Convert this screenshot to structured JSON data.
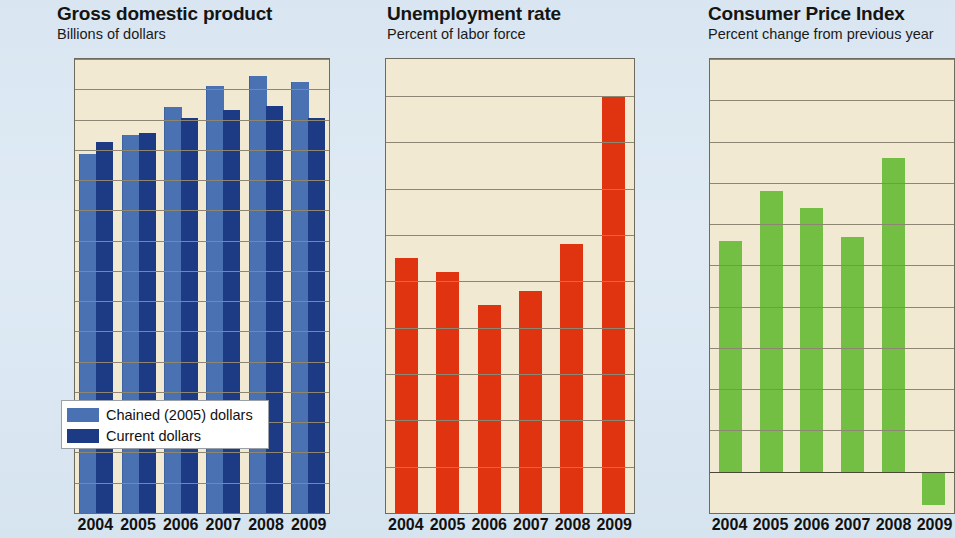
{
  "charts": [
    {
      "id": "gdp",
      "title": "Gross domestic product",
      "subtitle": "Billions of dollars",
      "legend": [
        {
          "label": "Chained (2005) dollars",
          "color": "#4a72b2"
        },
        {
          "label": "Current dollars",
          "color": "#1d3b85"
        }
      ]
    },
    {
      "id": "unemployment",
      "title": "Unemployment rate",
      "subtitle": "Percent of labor force"
    },
    {
      "id": "cpi",
      "title": "Consumer Price Index",
      "subtitle": "Percent change from previous year"
    }
  ],
  "chart_data": [
    {
      "type": "bar",
      "title": "Gross domestic product",
      "subtitle": "Billions of dollars",
      "xlabel": "",
      "ylabel": "Billions of dollars",
      "categories": [
        "2004",
        "2005",
        "2006",
        "2007",
        "2008",
        "2009"
      ],
      "series": [
        {
          "name": "Chained (2005) dollars",
          "color": "#4a72b2",
          "values": [
            11850,
            12500,
            13400,
            14100,
            14450,
            14250
          ]
        },
        {
          "name": "Current dollars",
          "color": "#1d3b85",
          "values": [
            12250,
            12550,
            13050,
            13300,
            13450,
            13050
          ]
        }
      ],
      "ylim": [
        0,
        15000
      ],
      "yticks": [
        "15,000",
        "14,000",
        "13,000",
        "12,000",
        "11,000",
        "10,000",
        "9,000",
        "8,000",
        "7,000",
        "6,000",
        "5,000",
        "4,000",
        "3,000",
        "2,000",
        "1,000",
        "0"
      ],
      "ytick_values": [
        15000,
        14000,
        13000,
        12000,
        11000,
        10000,
        9000,
        8000,
        7000,
        6000,
        5000,
        4000,
        3000,
        2000,
        1000,
        0
      ],
      "grid": true,
      "legend_position": "lower-left"
    },
    {
      "type": "bar",
      "title": "Unemployment rate",
      "subtitle": "Percent of labor force",
      "xlabel": "",
      "ylabel": "Percent of labor force",
      "categories": [
        "2004",
        "2005",
        "2006",
        "2007",
        "2008",
        "2009"
      ],
      "values": [
        5.5,
        5.2,
        4.5,
        4.8,
        5.8,
        9.0
      ],
      "color": "#e0330f",
      "ylim": [
        0,
        9.8
      ],
      "yticks": [
        "9",
        "8",
        "7",
        "6",
        "5",
        "4",
        "3",
        "2",
        "1",
        "0"
      ],
      "ytick_values": [
        9,
        8,
        7,
        6,
        5,
        4,
        3,
        2,
        1,
        0
      ],
      "grid": true,
      "legend_position": "none"
    },
    {
      "type": "bar",
      "title": "Consumer Price Index",
      "subtitle": "Percent change from previous year",
      "xlabel": "",
      "ylabel": "Percent change from previous year",
      "categories": [
        "2004",
        "2005",
        "2006",
        "2007",
        "2008",
        "2009"
      ],
      "values": [
        2.8,
        3.4,
        3.2,
        2.85,
        3.8,
        -0.4
      ],
      "color": "#72bf44",
      "ylim": [
        -0.5,
        5.0
      ],
      "yticks": [
        "5.0",
        "4.5",
        "4.0",
        "3.5",
        "3.0",
        "2.5",
        "2.0",
        "1.5",
        "1.0",
        "0.5",
        "0.0",
        "-0.5"
      ],
      "ytick_values": [
        5.0,
        4.5,
        4.0,
        3.5,
        3.0,
        2.5,
        2.0,
        1.5,
        1.0,
        0.5,
        0.0,
        -0.5
      ],
      "grid": true,
      "legend_position": "none"
    }
  ],
  "colors": {
    "page_background": "#dce8f2",
    "plot_background": "#f2e9d2",
    "gridline": "#8d8672",
    "chained_dollars": "#4a72b2",
    "current_dollars": "#1d3b85",
    "unemployment_bar": "#e0330f",
    "cpi_bar": "#72bf44"
  }
}
